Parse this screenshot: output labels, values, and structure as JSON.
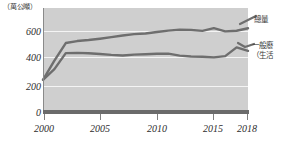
{
  "chart_data": {
    "type": "line",
    "title": "",
    "ylabel": "（萬公噸）",
    "xlabel": "",
    "ylim": [
      0,
      800
    ],
    "yticks": [
      0,
      200,
      400,
      600
    ],
    "xlim": [
      2000,
      2018
    ],
    "xticks": [
      2000,
      2005,
      2010,
      2015,
      2018
    ],
    "xtick_labels": [
      "2000",
      "2005",
      "2010",
      "2015",
      "2018"
    ],
    "grid": true,
    "legend_position": "right",
    "x": [
      2000,
      2001,
      2002,
      2003,
      2004,
      2005,
      2006,
      2007,
      2008,
      2009,
      2010,
      2011,
      2012,
      2013,
      2014,
      2015,
      2016,
      2017,
      2018
    ],
    "series": [
      {
        "name": "總量",
        "color": "#6e6e6e",
        "values": [
          253,
          399,
          533,
          548,
          556,
          566,
          578,
          590,
          601,
          606,
          617,
          628,
          634,
          632,
          626,
          647,
          622,
          627,
          646
        ]
      },
      {
        "name": "一般廢棄物（生活垃圾）",
        "color": "#6e6e6e",
        "values": [
          253,
          334,
          456,
          458,
          455,
          450,
          443,
          438,
          445,
          448,
          452,
          452,
          437,
          430,
          428,
          424,
          433,
          500,
          474
        ]
      }
    ]
  },
  "axis": {
    "unit_caption": "（萬公噸）",
    "ytick_labels": [
      "600",
      "400",
      "200",
      "0"
    ],
    "xtick_labels": [
      "2000",
      "2005",
      "2010",
      "2015",
      "2018"
    ]
  },
  "legend": {
    "total": {
      "label": "總量"
    },
    "general": {
      "label": "一般廢",
      "sublabel": "（生活"
    }
  }
}
